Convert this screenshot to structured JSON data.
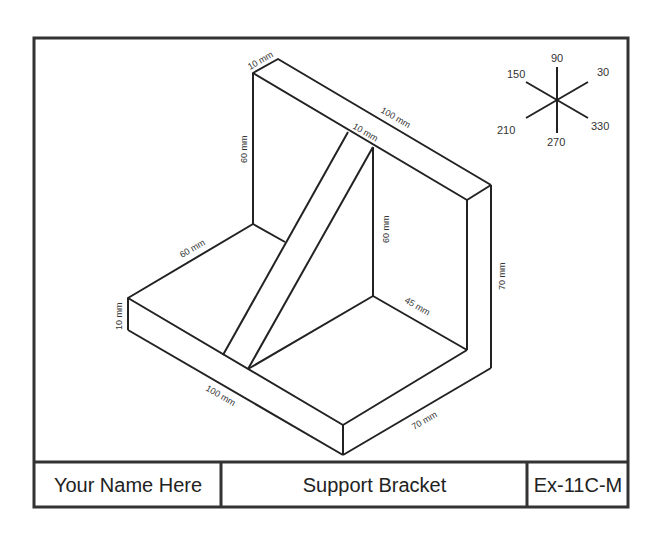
{
  "title_block": {
    "name": "Your Name Here",
    "title": "Support Bracket",
    "exercise": "Ex-11C-M"
  },
  "axis_indicator": {
    "labels": [
      "90",
      "30",
      "150",
      "210",
      "270",
      "330"
    ]
  },
  "dimensions": {
    "top_thickness": "10 mm",
    "top_length": "100 mm",
    "rib_thickness": "10 mm",
    "back_height": "60 mm",
    "rib_height": "60 mm",
    "right_height": "70 mm",
    "base_depth": "60 mm",
    "rib_base": "45 mm",
    "base_thickness": "10 mm",
    "base_length": "100 mm",
    "base_width": "70 mm"
  },
  "colors": {
    "line": "#222222",
    "border": "#333333"
  }
}
